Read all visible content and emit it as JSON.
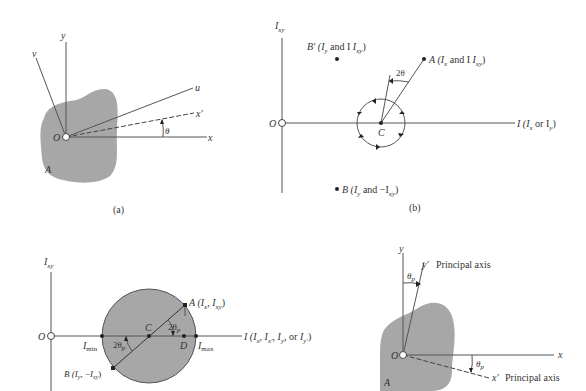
{
  "panel_a": {
    "caption": "(a)",
    "axis_y": "y",
    "axis_v": "v",
    "axis_u": "u",
    "axis_xprime": "x′",
    "axis_x": "x",
    "origin": "O",
    "angle": "θ",
    "area": "A"
  },
  "panel_b": {
    "caption": "(b)",
    "vertical_axis": "I",
    "vertical_axis_sub": "xy",
    "horizontal_axis": "I (I",
    "horizontal_axis_tail": "or I",
    "origin": "O",
    "center": "C",
    "angle": "2θ",
    "point_A": "A (I",
    "point_A_mid": "and I",
    "point_B_prime": "B′ (I",
    "point_B_prime_mid": "and I",
    "point_B": "B (I",
    "point_B_mid": "and −I"
  },
  "panel_c": {
    "vertical_axis": "I",
    "vertical_axis_sub": "xy",
    "origin": "O",
    "center": "C",
    "point_D": "D",
    "i_min": "I",
    "i_min_sub": "min",
    "i_max": "I",
    "i_max_sub": "max",
    "angle_top": "2θ",
    "angle_bottom": "2θ",
    "angle_sub": "p",
    "point_A": "A (I",
    "point_B": "B (I",
    "horizontal_axis": "I (I"
  },
  "panel_d": {
    "axis_y": "y",
    "axis_yprime": "y′",
    "axis_x": "x",
    "axis_xprime": "x′",
    "principal_axis_label_1": "Principal axis",
    "principal_axis_label_2": "Principal axis",
    "origin": "O",
    "angle_top": "θ",
    "angle_bottom": "θ",
    "angle_sub": "p",
    "area": "A"
  }
}
